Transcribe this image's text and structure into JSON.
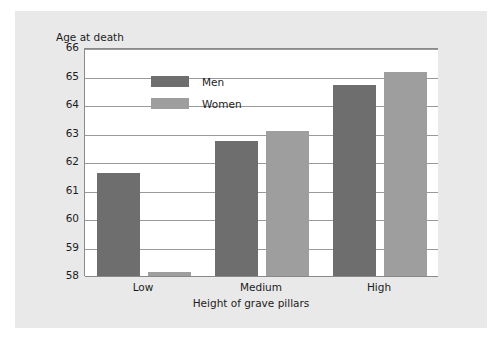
{
  "chart_data": {
    "type": "bar",
    "title": "",
    "ylabel": "Age at death",
    "xlabel": "Height of grave pillars",
    "categories": [
      "Low",
      "Medium",
      "High"
    ],
    "series": [
      {
        "name": "Men",
        "color": "#6e6e6e",
        "values": [
          61.6,
          62.75,
          64.7
        ]
      },
      {
        "name": "Women",
        "color": "#9e9e9e",
        "values": [
          58.15,
          63.1,
          65.15
        ]
      }
    ],
    "ylim": [
      58,
      66
    ],
    "yticks": [
      58,
      59,
      60,
      61,
      62,
      63,
      64,
      65,
      66
    ],
    "ytick_labels": [
      "58",
      "59",
      "60",
      "61",
      "62",
      "63",
      "64",
      "65",
      "66"
    ],
    "grid": true,
    "legend_position": "upper-left-inside",
    "plot_background": "#ffffff",
    "figure_background": "#e9e9e9"
  }
}
